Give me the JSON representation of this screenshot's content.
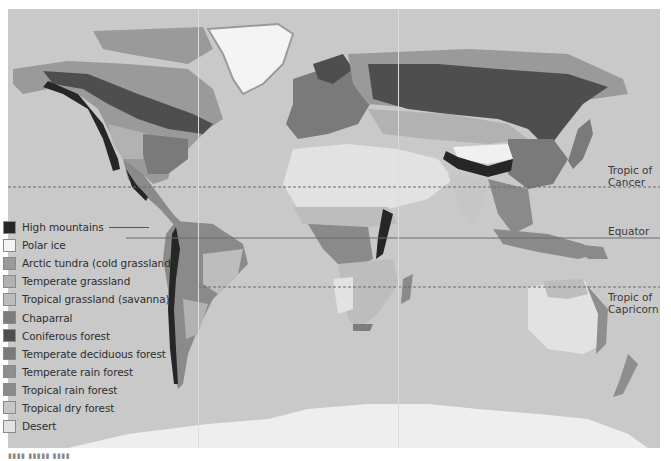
{
  "map": {
    "title": "World biomes",
    "background_ocean": "#c9c9c9",
    "latitude_lines": [
      {
        "name": "Tropic of Cancer",
        "label_line1": "Tropic of",
        "label_line2": "Cancer",
        "style": "dashed"
      },
      {
        "name": "Equator",
        "label_line1": "Equator",
        "label_line2": "",
        "style": "solid"
      },
      {
        "name": "Tropic of Capricorn",
        "label_line1": "Tropic of",
        "label_line2": "Capricorn",
        "style": "dashed"
      }
    ]
  },
  "legend": {
    "items": [
      {
        "label": "High mountains",
        "color": "#262626"
      },
      {
        "label": "Polar ice",
        "color": "#f4f4f4"
      },
      {
        "label": "Arctic tundra (cold grassland)",
        "color": "#9a9a9a"
      },
      {
        "label": "Temperate grassland",
        "color": "#b2b2b2"
      },
      {
        "label": "Tropical grassland (savanna)",
        "color": "#bdbdbd"
      },
      {
        "label": "Chaparral",
        "color": "#7d7d7d"
      },
      {
        "label": "Coniferous forest",
        "color": "#4e4e4e"
      },
      {
        "label": "Temperate deciduous forest",
        "color": "#7a7a7a"
      },
      {
        "label": "Temperate rain forest",
        "color": "#8e8e8e"
      },
      {
        "label": "Tropical rain forest",
        "color": "#8a8a8a"
      },
      {
        "label": "Tropical dry forest",
        "color": "#c6c6c6"
      },
      {
        "label": "Desert",
        "color": "#e2e2e2"
      }
    ]
  },
  "caption": {
    "text": "▮▮▮▮ ▮▮▮▮▮ ▮▮▮▮"
  }
}
